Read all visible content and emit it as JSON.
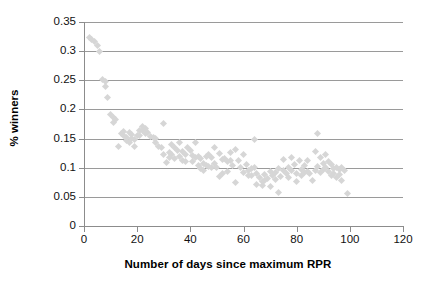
{
  "chart_data": {
    "type": "scatter",
    "title": "",
    "xlabel": "Number of days since maximum RPR",
    "ylabel": "% winners",
    "xlim": [
      0,
      120
    ],
    "ylim": [
      0,
      0.35
    ],
    "xticks": [
      0,
      20,
      40,
      60,
      80,
      100,
      120
    ],
    "yticks": [
      0,
      0.05,
      0.1,
      0.15,
      0.2,
      0.25,
      0.3,
      0.35
    ],
    "xtick_labels": [
      "0",
      "20",
      "40",
      "60",
      "80",
      "100",
      "120"
    ],
    "ytick_labels": [
      "0",
      "0.05",
      "0.1",
      "0.15",
      "0.2",
      "0.25",
      "0.3",
      "0.35"
    ],
    "grid": "horizontal",
    "legend": "none",
    "marker": "diamond",
    "marker_color": "#d6d6d6",
    "series": [
      {
        "name": "% winners by days since maximum RPR",
        "points": [
          [
            2,
            0.323
          ],
          [
            3,
            0.32
          ],
          [
            4,
            0.316
          ],
          [
            5,
            0.31
          ],
          [
            6,
            0.3
          ],
          [
            7,
            0.252
          ],
          [
            8,
            0.248
          ],
          [
            8,
            0.24
          ],
          [
            9,
            0.221
          ],
          [
            10,
            0.192
          ],
          [
            11,
            0.186
          ],
          [
            11,
            0.178
          ],
          [
            12,
            0.182
          ],
          [
            13,
            0.136
          ],
          [
            14,
            0.158
          ],
          [
            15,
            0.162
          ],
          [
            15,
            0.155
          ],
          [
            16,
            0.152
          ],
          [
            16,
            0.146
          ],
          [
            17,
            0.16
          ],
          [
            17,
            0.143
          ],
          [
            18,
            0.157
          ],
          [
            18,
            0.15
          ],
          [
            19,
            0.148
          ],
          [
            19,
            0.136
          ],
          [
            20,
            0.156
          ],
          [
            21,
            0.163
          ],
          [
            21,
            0.155
          ],
          [
            22,
            0.17
          ],
          [
            22,
            0.163
          ],
          [
            23,
            0.167
          ],
          [
            23,
            0.158
          ],
          [
            24,
            0.16
          ],
          [
            25,
            0.154
          ],
          [
            26,
            0.152
          ],
          [
            27,
            0.15
          ],
          [
            27,
            0.143
          ],
          [
            28,
            0.136
          ],
          [
            29,
            0.134
          ],
          [
            30,
            0.176
          ],
          [
            30,
            0.122
          ],
          [
            31,
            0.109
          ],
          [
            32,
            0.126
          ],
          [
            32,
            0.118
          ],
          [
            33,
            0.139
          ],
          [
            33,
            0.122
          ],
          [
            34,
            0.135
          ],
          [
            34,
            0.116
          ],
          [
            35,
            0.13
          ],
          [
            36,
            0.143
          ],
          [
            36,
            0.119
          ],
          [
            37,
            0.127
          ],
          [
            37,
            0.112
          ],
          [
            38,
            0.123
          ],
          [
            38,
            0.11
          ],
          [
            39,
            0.134
          ],
          [
            40,
            0.129
          ],
          [
            41,
            0.121
          ],
          [
            41,
            0.11
          ],
          [
            42,
            0.143
          ],
          [
            42,
            0.117
          ],
          [
            43,
            0.12
          ],
          [
            43,
            0.103
          ],
          [
            44,
            0.115
          ],
          [
            44,
            0.099
          ],
          [
            45,
            0.108
          ],
          [
            45,
            0.096
          ],
          [
            46,
            0.119
          ],
          [
            46,
            0.104
          ],
          [
            47,
            0.122
          ],
          [
            47,
            0.102
          ],
          [
            48,
            0.118
          ],
          [
            48,
            0.101
          ],
          [
            49,
            0.134
          ],
          [
            49,
            0.108
          ],
          [
            50,
            0.1
          ],
          [
            51,
            0.124
          ],
          [
            51,
            0.085
          ],
          [
            52,
            0.114
          ],
          [
            52,
            0.09
          ],
          [
            53,
            0.116
          ],
          [
            54,
            0.11
          ],
          [
            54,
            0.094
          ],
          [
            55,
            0.126
          ],
          [
            55,
            0.112
          ],
          [
            56,
            0.104
          ],
          [
            57,
            0.131
          ],
          [
            57,
            0.074
          ],
          [
            58,
            0.113
          ],
          [
            59,
            0.1
          ],
          [
            60,
            0.122
          ],
          [
            60,
            0.091
          ],
          [
            61,
            0.105
          ],
          [
            62,
            0.095
          ],
          [
            62,
            0.087
          ],
          [
            63,
            0.098
          ],
          [
            63,
            0.086
          ],
          [
            64,
            0.149
          ],
          [
            64,
            0.1
          ],
          [
            65,
            0.09
          ],
          [
            65,
            0.072
          ],
          [
            66,
            0.084
          ],
          [
            67,
            0.077
          ],
          [
            67,
            0.069
          ],
          [
            68,
            0.089
          ],
          [
            68,
            0.078
          ],
          [
            69,
            0.082
          ],
          [
            70,
            0.094
          ],
          [
            70,
            0.068
          ],
          [
            71,
            0.087
          ],
          [
            72,
            0.092
          ],
          [
            72,
            0.08
          ],
          [
            73,
            0.099
          ],
          [
            73,
            0.058
          ],
          [
            74,
            0.085
          ],
          [
            75,
            0.114
          ],
          [
            75,
            0.095
          ],
          [
            76,
            0.09
          ],
          [
            77,
            0.101
          ],
          [
            77,
            0.083
          ],
          [
            78,
            0.118
          ],
          [
            78,
            0.096
          ],
          [
            79,
            0.105
          ],
          [
            80,
            0.09
          ],
          [
            80,
            0.076
          ],
          [
            81,
            0.112
          ],
          [
            82,
            0.097
          ],
          [
            82,
            0.086
          ],
          [
            83,
            0.103
          ],
          [
            83,
            0.092
          ],
          [
            84,
            0.112
          ],
          [
            84,
            0.094
          ],
          [
            85,
            0.09
          ],
          [
            86,
            0.078
          ],
          [
            87,
            0.128
          ],
          [
            87,
            0.096
          ],
          [
            88,
            0.159
          ],
          [
            88,
            0.102
          ],
          [
            89,
            0.118
          ],
          [
            89,
            0.091
          ],
          [
            90,
            0.108
          ],
          [
            90,
            0.097
          ],
          [
            91,
            0.122
          ],
          [
            91,
            0.1
          ],
          [
            92,
            0.111
          ],
          [
            92,
            0.094
          ],
          [
            93,
            0.105
          ],
          [
            93,
            0.086
          ],
          [
            94,
            0.099
          ],
          [
            94,
            0.09
          ],
          [
            95,
            0.101
          ],
          [
            95,
            0.084
          ],
          [
            96,
            0.097
          ],
          [
            96,
            0.088
          ],
          [
            97,
            0.1
          ],
          [
            97,
            0.078
          ],
          [
            98,
            0.096
          ],
          [
            99,
            0.055
          ]
        ]
      }
    ]
  }
}
